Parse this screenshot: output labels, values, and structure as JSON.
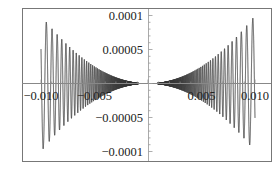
{
  "chart_data": {
    "type": "line",
    "title": "",
    "xlabel": "",
    "ylabel": "",
    "function": "x^2 * sin(1/x)",
    "xlim": [
      -0.0105,
      0.0105
    ],
    "ylim": [
      -0.00011,
      0.00011
    ],
    "domain": [
      -0.01,
      0.01
    ],
    "envelope": "±x^2",
    "series": [
      {
        "name": "f(x)",
        "color": "#444444",
        "sample_points": [
          {
            "x": -0.01,
            "y": 5.06e-05
          },
          {
            "x": -0.0075,
            "y": -1.87e-05
          },
          {
            "x": -0.005,
            "y": 2.18e-05
          },
          {
            "x": -0.0025,
            "y": -5.4e-06
          },
          {
            "x": 0.0,
            "y": 0.0
          },
          {
            "x": 0.0025,
            "y": 5.4e-06
          },
          {
            "x": 0.005,
            "y": -2.18e-05
          },
          {
            "x": 0.0075,
            "y": 1.87e-05
          },
          {
            "x": 0.01,
            "y": -5.06e-05
          }
        ]
      }
    ],
    "x_ticks": [
      {
        "value": -0.01,
        "label": "−0.010"
      },
      {
        "value": -0.005,
        "label": "−0.005"
      },
      {
        "value": 0.005,
        "label": "0.005"
      },
      {
        "value": 0.01,
        "label": "0.010"
      }
    ],
    "y_ticks": [
      {
        "value": 0.0001,
        "label": "0.0001"
      },
      {
        "value": 5e-05,
        "label": "0.00005"
      },
      {
        "value": -5e-05,
        "label": "−0.00005"
      },
      {
        "value": -0.0001,
        "label": "−0.0001"
      }
    ],
    "grid": false,
    "legend": null,
    "frame": true,
    "colors": {
      "curve": "#3a3a3a",
      "axis": "#888888",
      "frame": "#777777",
      "text": "#222222"
    }
  }
}
